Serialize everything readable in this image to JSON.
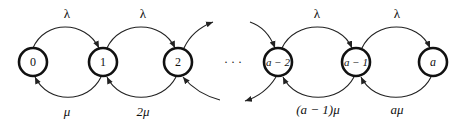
{
  "diagram": {
    "type": "birth-death state transition diagram",
    "nodes": [
      {
        "id": "n0",
        "label": "0"
      },
      {
        "id": "n1",
        "label": "1"
      },
      {
        "id": "n2",
        "label": "2"
      },
      {
        "id": "na2",
        "label": "a − 2"
      },
      {
        "id": "na1",
        "label": "a − 1"
      },
      {
        "id": "na",
        "label": "a"
      }
    ],
    "ellipsis": "· · ·",
    "forward_labels": [
      "λ",
      "λ",
      "λ",
      "λ"
    ],
    "backward_labels": [
      "μ",
      "2μ",
      "(a − 1)μ",
      "aμ"
    ],
    "colors": {
      "stroke": "#111111",
      "background": "#ffffff"
    }
  }
}
